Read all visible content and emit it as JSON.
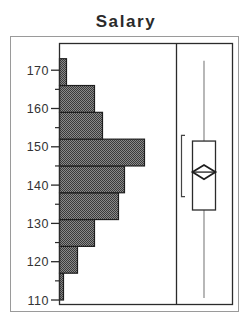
{
  "chart_data": {
    "type": "bar",
    "title": "Salary",
    "orientation": "horizontal-histogram",
    "xlabel": "",
    "ylabel": "",
    "ylim": [
      110,
      175
    ],
    "yticks": [
      110,
      120,
      130,
      140,
      150,
      160,
      170
    ],
    "bins": [
      {
        "from": 110,
        "to": 117,
        "count": 4
      },
      {
        "from": 117,
        "to": 124,
        "count": 18
      },
      {
        "from": 124,
        "to": 131,
        "count": 35
      },
      {
        "from": 131,
        "to": 138,
        "count": 59
      },
      {
        "from": 138,
        "to": 145,
        "count": 65
      },
      {
        "from": 145,
        "to": 152,
        "count": 85
      },
      {
        "from": 152,
        "to": 159,
        "count": 43
      },
      {
        "from": 159,
        "to": 166,
        "count": 35
      },
      {
        "from": 166,
        "to": 173,
        "count": 7
      }
    ],
    "grid": false,
    "legend": null,
    "boxplot": {
      "whisker_low": 110.5,
      "q1": 133.5,
      "median": 143.4,
      "mean": 143.4,
      "q3": 151.5,
      "whisker_high": 172.5,
      "mean_diamond_low": 141.6,
      "mean_diamond_high": 145.3,
      "shortest_half_low": 137.0,
      "shortest_half_high": 153.0
    }
  },
  "colors": {
    "bar_fill": "#6e6e6e",
    "bar_edge": "#1e1e1e",
    "frame": "#2b2b2b",
    "outer_frame": "#9a9a9a",
    "whisker": "#888888"
  }
}
